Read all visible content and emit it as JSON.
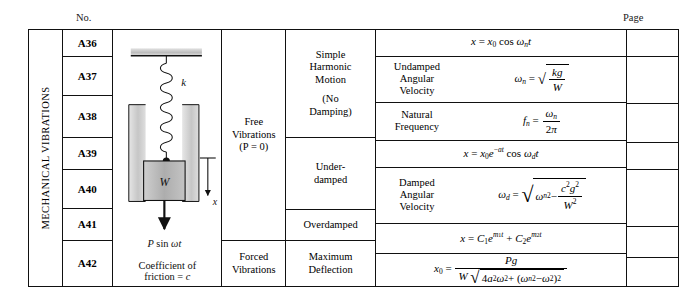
{
  "headers": {
    "no": "No.",
    "page": "Page"
  },
  "category": {
    "label": "MECHANICAL VIBRATIONS"
  },
  "numbers": [
    "A36",
    "A37",
    "A38",
    "A39",
    "A40",
    "A41",
    "A42"
  ],
  "diagram": {
    "spring_label": "k",
    "mass_label": "W",
    "force_label": "P sin ωt",
    "displacement_label": "x",
    "caption_line1": "Coefficient of",
    "caption_line2": "friction = c"
  },
  "vibration_types": [
    {
      "label": "Free Vibrations (P = 0)",
      "line1": "Free",
      "line2": "Vibrations",
      "line3": "(P = 0)"
    },
    {
      "label": "Forced Vibrations",
      "line1": "Forced",
      "line2": "Vibrations",
      "line3": ""
    }
  ],
  "motion_types": [
    {
      "line1": "Simple",
      "line2": "Harmonic",
      "line3": "Motion",
      "line4": "(No",
      "line5": "Damping)"
    },
    {
      "line1": "Under-",
      "line2": "damped",
      "line3": "",
      "line4": "",
      "line5": ""
    },
    {
      "line1": "Overdamped",
      "line2": "",
      "line3": "",
      "line4": "",
      "line5": ""
    },
    {
      "line1": "Maximum",
      "line2": "Deflection",
      "line3": "",
      "line4": "",
      "line5": ""
    }
  ],
  "formulas": [
    {
      "id": "shm-displacement",
      "label": "",
      "text": "x = x₀ cos ωₙt"
    },
    {
      "id": "undamped-angular-velocity",
      "label_line1": "Undamped",
      "label_line2": "Angular",
      "label_line3": "Velocity",
      "text": "ωₙ = √(kg/W)"
    },
    {
      "id": "natural-frequency",
      "label_line1": "Natural",
      "label_line2": "Frequency",
      "label_line3": "",
      "text": "fₙ = ωₙ/(2π)"
    },
    {
      "id": "underdamped-displacement",
      "label": "",
      "text": "x = x₀e⁻ᵃᵗ cos ω_d t"
    },
    {
      "id": "damped-angular-velocity",
      "label_line1": "Damped",
      "label_line2": "Angular",
      "label_line3": "Velocity",
      "text": "ω_d = √(ωₙ² − c²g²/W²)"
    },
    {
      "id": "overdamped-displacement",
      "label": "",
      "text": "x = C₁e^(m₁t) + C₂e^(m₂t)"
    },
    {
      "id": "maximum-deflection",
      "label": "",
      "text": "x₀ = Pg / (W√(4a²ω² + (ωₙ² − ω²)²))"
    }
  ],
  "page_entries": [
    "",
    "",
    "",
    "",
    "",
    "",
    ""
  ],
  "colors": {
    "ink": "#111111",
    "mass_fill": "#b8b8b8",
    "channel_fill": "#cfcfcf",
    "ceiling_fill": "#c9c9c9"
  }
}
